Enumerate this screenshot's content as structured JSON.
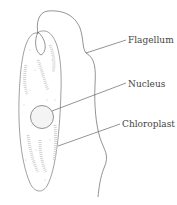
{
  "diagram": {
    "labels": {
      "flagellum": "Flagellum",
      "nucleus": "Nucleus",
      "chloroplast": "Chloroplast"
    },
    "colors": {
      "line": "#6a6a6a",
      "text": "#444444",
      "stipple": "#b0b0b0"
    }
  }
}
